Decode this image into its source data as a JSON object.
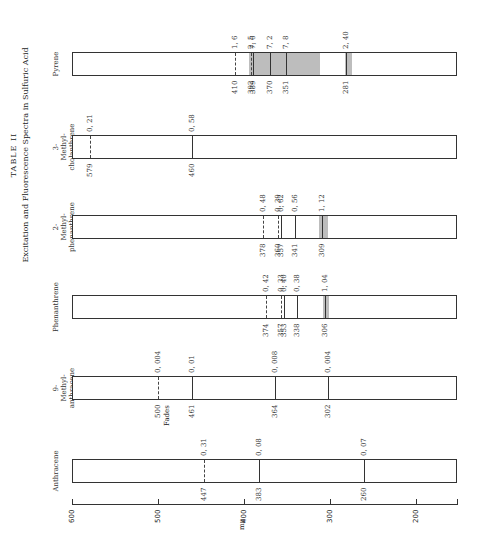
{
  "title": {
    "line1": "TABLE II",
    "line2": "Excitation and Fluorescence Spectra in Sulfuric Acid"
  },
  "axis": {
    "unit": "mμ",
    "ticks": [
      600,
      500,
      400,
      300,
      200
    ],
    "range": [
      600,
      150
    ]
  },
  "compounds": [
    {
      "name": "Pyrene",
      "lines": [
        {
          "wl": 410,
          "val": "1.6",
          "style": "dashed"
        },
        {
          "wl": 392,
          "val": "2.5",
          "style": "dashed"
        },
        {
          "wl": 389,
          "val": "7.6",
          "style": "solid"
        },
        {
          "wl": 370,
          "val": "7.2",
          "style": "solid"
        },
        {
          "wl": 351,
          "val": "7.8",
          "style": "solid"
        },
        {
          "wl": 281,
          "val": "2.40",
          "style": "solid"
        }
      ],
      "shaded": [
        [
          395,
          313
        ],
        [
          284,
          275
        ]
      ]
    },
    {
      "name": "3-Methyl-cholanthrene",
      "lines": [
        {
          "wl": 579,
          "val": "0.21",
          "style": "dashed"
        },
        {
          "wl": 460,
          "val": "0.58",
          "style": "solid"
        }
      ],
      "shaded": []
    },
    {
      "name": "2-Methyl-phenanthrene",
      "lines": [
        {
          "wl": 378,
          "val": "0.48",
          "style": "dashed"
        },
        {
          "wl": 360,
          "val": "0.39",
          "style": "dashed"
        },
        {
          "wl": 357,
          "val": "0.62",
          "style": "solid"
        },
        {
          "wl": 341,
          "val": "0.56",
          "style": "solid"
        },
        {
          "wl": 309,
          "val": "1.12",
          "style": "solid"
        }
      ],
      "shaded": [
        [
          314,
          304
        ]
      ]
    },
    {
      "name": "Phenanthrene",
      "lines": [
        {
          "wl": 374,
          "val": "0.42",
          "style": "dashed"
        },
        {
          "wl": 357,
          "val": "0.33",
          "style": "dashed"
        },
        {
          "wl": 353,
          "val": "0.40",
          "style": "solid"
        },
        {
          "wl": 338,
          "val": "0.38",
          "style": "solid"
        },
        {
          "wl": 306,
          "val": "1.04",
          "style": "solid"
        }
      ],
      "shaded": [
        [
          309,
          302
        ]
      ]
    },
    {
      "name": "9-Methyl-anthracene",
      "lines": [
        {
          "wl": 500,
          "val": "0.004",
          "style": "dashed",
          "note": "Fades"
        },
        {
          "wl": 461,
          "val": "0.01",
          "style": "solid"
        },
        {
          "wl": 364,
          "val": "0.008",
          "style": "solid"
        },
        {
          "wl": 302,
          "val": "0.004",
          "style": "solid"
        }
      ],
      "shaded": []
    },
    {
      "name": "Anthracene",
      "lines": [
        {
          "wl": 447,
          "val": "0.31",
          "style": "dashed"
        },
        {
          "wl": 383,
          "val": "0.08",
          "style": "solid"
        },
        {
          "wl": 260,
          "val": "0.07",
          "style": "solid"
        }
      ],
      "shaded": []
    }
  ],
  "chart_data": {
    "type": "table",
    "xlabel": "mμ",
    "xlim": [
      600,
      150
    ],
    "x_ticks": [
      600,
      500,
      400,
      300,
      200
    ],
    "series": [
      {
        "name": "Pyrene",
        "wavelengths": [
          410,
          392,
          389,
          370,
          351,
          281
        ],
        "values": [
          1.6,
          2.5,
          7.6,
          7.2,
          7.8,
          2.4
        ]
      },
      {
        "name": "3-Methylcholanthrene",
        "wavelengths": [
          579,
          460
        ],
        "values": [
          0.21,
          0.58
        ]
      },
      {
        "name": "2-Methylphenanthrene",
        "wavelengths": [
          378,
          360,
          357,
          341,
          309
        ],
        "values": [
          0.48,
          0.39,
          0.62,
          0.56,
          1.12
        ]
      },
      {
        "name": "Phenanthrene",
        "wavelengths": [
          374,
          357,
          353,
          338,
          306
        ],
        "values": [
          0.42,
          0.33,
          0.4,
          0.38,
          1.04
        ]
      },
      {
        "name": "9-Methylanthracene",
        "wavelengths": [
          500,
          461,
          364,
          302
        ],
        "values": [
          0.004,
          0.01,
          0.008,
          0.004
        ],
        "annotations": [
          "500: Fades"
        ]
      },
      {
        "name": "Anthracene",
        "wavelengths": [
          447,
          383,
          260
        ],
        "values": [
          0.31,
          0.08,
          0.07
        ]
      }
    ],
    "legend": "dashed = fluorescence band, solid = excitation band, shaded = broad band region",
    "grid": false
  }
}
